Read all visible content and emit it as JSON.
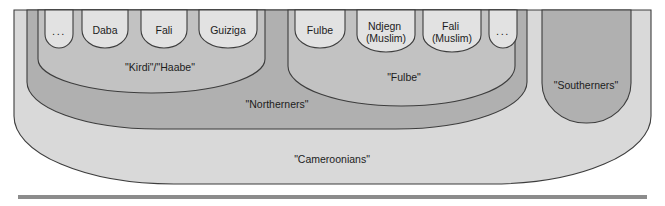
{
  "diagram": {
    "title": "Nested ethnic identity categories (Cameroon)",
    "type": "nested-set-diagram",
    "background_color": "#ffffff",
    "stroke_color": "#3d3d3d",
    "baseline_rule_color": "#8c8c8c",
    "levels": [
      {
        "level": 1,
        "name": "Cameroonians",
        "label": "\"Cameroonians\"",
        "fill": "#d9d9d9",
        "label_x": 332,
        "label_y": 160
      },
      {
        "level": 2,
        "name": "Northerners",
        "label": "\"Northerners\"",
        "fill": "#b0b0b0",
        "label_x": 277,
        "label_y": 105
      },
      {
        "level": 2,
        "name": "Southerners",
        "label": "\"Southerners\"",
        "fill": "#b0b0b0",
        "label_x": 586,
        "label_y": 86
      },
      {
        "level": 3,
        "name": "Kirdi-Haabe",
        "label": "\"Kirdi\"/\"Haabe\"",
        "fill": "#c2c2c2",
        "label_x": 160,
        "label_y": 68
      },
      {
        "level": 3,
        "name": "Fulbe-group",
        "label": "\"Fulbe\"",
        "fill": "#c2c2c2",
        "label_x": 404,
        "label_y": 78
      }
    ],
    "leaf_groups": [
      {
        "parent": "Kirdi-Haabe",
        "members": [
          {
            "label": "...",
            "is_ellipsis": true,
            "x": 59,
            "cx": 59,
            "width": 38,
            "lines": [
              "..."
            ]
          },
          {
            "label": "Daba",
            "is_ellipsis": false,
            "x": 105,
            "cx": 105,
            "width": 52,
            "lines": [
              "Daba"
            ]
          },
          {
            "label": "Fali",
            "is_ellipsis": false,
            "x": 164,
            "cx": 164,
            "width": 52,
            "lines": [
              "Fali"
            ]
          },
          {
            "label": "Guiziga",
            "is_ellipsis": false,
            "x": 228,
            "cx": 228,
            "width": 62,
            "lines": [
              "Guiziga"
            ]
          }
        ]
      },
      {
        "parent": "Fulbe-group",
        "members": [
          {
            "label": "Fulbe",
            "is_ellipsis": false,
            "x": 320,
            "cx": 320,
            "width": 56,
            "lines": [
              "Fulbe"
            ]
          },
          {
            "label": "Ndjegn (Muslim)",
            "is_ellipsis": false,
            "x": 386,
            "cx": 386,
            "width": 62,
            "lines": [
              "Ndjegn",
              "(Muslim)"
            ]
          },
          {
            "label": "Fali (Muslim)",
            "is_ellipsis": false,
            "x": 452,
            "cx": 452,
            "width": 62,
            "lines": [
              "Fali",
              "(Muslim)"
            ]
          },
          {
            "label": "...",
            "is_ellipsis": true,
            "x": 503,
            "cx": 503,
            "width": 38,
            "lines": [
              "..."
            ]
          }
        ]
      }
    ]
  }
}
